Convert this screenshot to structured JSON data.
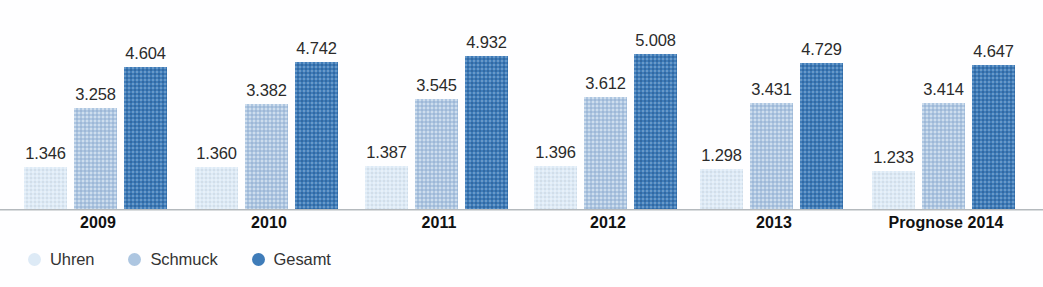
{
  "chart_data": {
    "type": "bar",
    "title": "",
    "subtitle": "",
    "xlabel": "",
    "ylabel": "",
    "ylim": [
      0,
      5600
    ],
    "grid": false,
    "legend_position": "bottom-left",
    "number_format": "german-thousands-dot",
    "categories": [
      "2009",
      "2010",
      "2011",
      "2012",
      "2013",
      "Prognose 2014"
    ],
    "series": [
      {
        "name": "Uhren",
        "color": "#ddeaf6",
        "values": [
          1346,
          1360,
          1387,
          1396,
          1298,
          1233
        ],
        "labels": [
          "1.346",
          "1.360",
          "1.387",
          "1.396",
          "1.298",
          "1.233"
        ]
      },
      {
        "name": "Schmuck",
        "color": "#adc6e1",
        "values": [
          3258,
          3382,
          3545,
          3612,
          3431,
          3414
        ],
        "labels": [
          "3.258",
          "3.382",
          "3.545",
          "3.612",
          "3.431",
          "3.414"
        ]
      },
      {
        "name": "Gesamt",
        "color": "#3f7cb9",
        "values": [
          4604,
          4742,
          4932,
          5008,
          4729,
          4647
        ],
        "labels": [
          "4.604",
          "4.742",
          "4.932",
          "5.008",
          "4.729",
          "4.647"
        ]
      }
    ]
  },
  "axis": {
    "baseline_color": "#b4b9bd"
  },
  "legend": {
    "items": [
      {
        "label": "Uhren",
        "marker": "circle-marker-uhren",
        "color": "#ddeaf6"
      },
      {
        "label": "Schmuck",
        "marker": "circle-marker-schmuck",
        "color": "#adc6e1"
      },
      {
        "label": "Gesamt",
        "marker": "circle-marker-gesamt",
        "color": "#3f7cb9"
      }
    ]
  }
}
